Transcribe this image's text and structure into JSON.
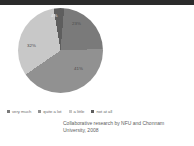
{
  "slide": {
    "background_color": "#ffffff",
    "topbar_color": "#2b2b2b"
  },
  "chart_data": {
    "type": "pie",
    "title": "",
    "legend_position": "bottom",
    "grid": false,
    "categories": [
      "very much",
      "quite a lot",
      "a little",
      "not at all"
    ],
    "values": [
      23,
      41,
      32,
      4
    ],
    "labels": [
      "23%",
      "41%",
      "32%",
      "4%"
    ],
    "colors": [
      "#7a7a7a",
      "#919191",
      "#c8c8c8",
      "#5e5e5e"
    ]
  },
  "legend": {
    "items": [
      {
        "label": "very much",
        "color": "#7a7a7a"
      },
      {
        "label": "quite a lot",
        "color": "#919191"
      },
      {
        "label": "a little",
        "color": "#c8c8c8"
      },
      {
        "label": "not at all",
        "color": "#5e5e5e"
      }
    ]
  },
  "caption": {
    "line1": "Collaborative research by NFU and Chonnam",
    "line2": "University, 2008"
  }
}
